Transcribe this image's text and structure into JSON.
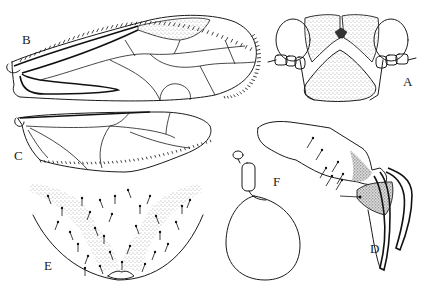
{
  "figure": {
    "type": "entomological anatomical plate",
    "labels": {
      "A": "A",
      "B": "B",
      "C": "C",
      "D": "D",
      "E": "E",
      "F": "F"
    },
    "panels": [
      {
        "id": "A",
        "subject": "head, frontal view"
      },
      {
        "id": "B",
        "subject": "forewing"
      },
      {
        "id": "C",
        "subject": "hindwing"
      },
      {
        "id": "D",
        "subject": "male genitalia, lateral view"
      },
      {
        "id": "E",
        "subject": "subgenital plate with setae"
      },
      {
        "id": "F",
        "subject": "spermatheca"
      }
    ],
    "colors": {
      "ink": "#1a1a1a",
      "paper": "#ffffff"
    }
  }
}
